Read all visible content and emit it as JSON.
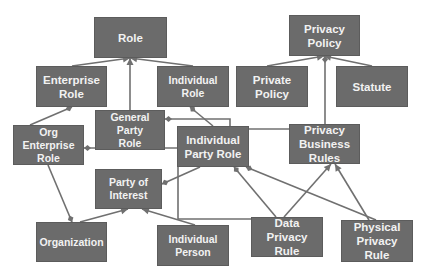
{
  "diagram": {
    "colors": {
      "node_fill": "#6b6b6b",
      "node_text": "#f2f2f2",
      "edge": "#707070",
      "background": "#ffffff"
    },
    "nodes": [
      {
        "id": "role",
        "label": "Role",
        "x": 94,
        "y": 17,
        "w": 73,
        "h": 41,
        "large": true
      },
      {
        "id": "enterprise_role",
        "label": "Enterprise\nRole",
        "x": 36,
        "y": 66,
        "w": 71,
        "h": 41,
        "large": true
      },
      {
        "id": "individual_role",
        "label": "Individual\nRole",
        "x": 157,
        "y": 66,
        "w": 72,
        "h": 41
      },
      {
        "id": "general_party_role",
        "label": "General Party\nRole",
        "x": 95,
        "y": 110,
        "w": 70,
        "h": 40
      },
      {
        "id": "org_enterprise_role",
        "label": "Org\nEnterprise\nRole",
        "x": 13,
        "y": 125,
        "w": 71,
        "h": 40
      },
      {
        "id": "individual_party_role",
        "label": "Individual\nParty Role",
        "x": 177,
        "y": 126,
        "w": 72,
        "h": 41,
        "large": true
      },
      {
        "id": "party_of_interest",
        "label": "Party of\nInterest",
        "x": 95,
        "y": 169,
        "w": 67,
        "h": 40
      },
      {
        "id": "organization",
        "label": "Organization",
        "x": 36,
        "y": 222,
        "w": 71,
        "h": 40
      },
      {
        "id": "individual_person",
        "label": "Individual\nPerson",
        "x": 157,
        "y": 225,
        "w": 72,
        "h": 41
      },
      {
        "id": "privacy_policy",
        "label": "Privacy\nPolicy",
        "x": 289,
        "y": 15,
        "w": 71,
        "h": 41,
        "large": true
      },
      {
        "id": "private_policy",
        "label": "Private\nPolicy",
        "x": 236,
        "y": 66,
        "w": 72,
        "h": 41,
        "large": true
      },
      {
        "id": "statute",
        "label": "Statute",
        "x": 336,
        "y": 66,
        "w": 72,
        "h": 41,
        "large": true
      },
      {
        "id": "privacy_business_rules",
        "label": "Privacy\nBusiness\nRules",
        "x": 289,
        "y": 124,
        "w": 71,
        "h": 40,
        "large": true
      },
      {
        "id": "data_privacy_rule",
        "label": "Data Privacy\nRule",
        "x": 251,
        "y": 217,
        "w": 72,
        "h": 40,
        "large": true
      },
      {
        "id": "physical_privacy_rule",
        "label": "Physical\nPrivacy Rule",
        "x": 341,
        "y": 220,
        "w": 72,
        "h": 42,
        "large": true
      }
    ],
    "edges": [
      {
        "from": "enterprise_role",
        "to": "role",
        "type": "generalization",
        "points": [
          [
            72,
            66
          ],
          [
            130,
            58
          ]
        ]
      },
      {
        "from": "individual_role",
        "to": "role",
        "type": "generalization",
        "points": [
          [
            193,
            66
          ],
          [
            130,
            58
          ]
        ]
      },
      {
        "from": "general_party_role",
        "to": "role",
        "type": "generalization",
        "points": [
          [
            130,
            110
          ],
          [
            130,
            58
          ]
        ]
      },
      {
        "from": "org_enterprise_role",
        "to": "enterprise_role",
        "type": "aggregation",
        "points": [
          [
            30,
            125
          ],
          [
            72,
            107
          ]
        ]
      },
      {
        "from": "individual_party_role",
        "to": "individual_role",
        "type": "aggregation",
        "points": [
          [
            213,
            126
          ],
          [
            190,
            107
          ]
        ]
      },
      {
        "from": "individual_party_role",
        "to": "general_party_role",
        "type": "aggregation",
        "points": [
          [
            230,
            126
          ],
          [
            230,
            119
          ],
          [
            165,
            119
          ]
        ]
      },
      {
        "from": "individual_party_role",
        "to": "org_enterprise_role",
        "type": "aggregation",
        "points": [
          [
            177,
            148
          ],
          [
            84,
            148
          ]
        ]
      },
      {
        "from": "individual_party_role",
        "to": "party_of_interest",
        "type": "aggregation",
        "points": [
          [
            200,
            167
          ],
          [
            162,
            184
          ]
        ]
      },
      {
        "from": "privacy_business_rules",
        "to": "individual_party_role",
        "type": "line",
        "points": [
          [
            289,
            129
          ],
          [
            249,
            129
          ]
        ]
      },
      {
        "from": "org_enterprise_role",
        "to": "organization",
        "type": "aggregation",
        "points": [
          [
            48,
            165
          ],
          [
            72,
            222
          ]
        ]
      },
      {
        "from": "organization",
        "to": "party_of_interest",
        "type": "generalization",
        "points": [
          [
            80,
            222
          ],
          [
            128,
            209
          ]
        ]
      },
      {
        "from": "individual_person",
        "to": "party_of_interest",
        "type": "generalization",
        "points": [
          [
            195,
            225
          ],
          [
            142,
            209
          ]
        ]
      },
      {
        "from": "data_privacy_rule",
        "to": "individual_party_role",
        "type": "line",
        "points": [
          [
            251,
            219
          ],
          [
            178,
            219
          ],
          [
            178,
            167
          ]
        ]
      },
      {
        "from": "private_policy",
        "to": "privacy_policy",
        "type": "generalization",
        "points": [
          [
            267,
            66
          ],
          [
            324,
            56
          ]
        ]
      },
      {
        "from": "statute",
        "to": "privacy_policy",
        "type": "generalization",
        "points": [
          [
            372,
            66
          ],
          [
            324,
            56
          ]
        ]
      },
      {
        "from": "privacy_business_rules",
        "to": "privacy_policy",
        "type": "aggregation",
        "points": [
          [
            325,
            124
          ],
          [
            325,
            56
          ]
        ]
      },
      {
        "from": "data_privacy_rule",
        "to": "individual_party_role",
        "type": "aggregation",
        "points": [
          [
            276,
            217
          ],
          [
            234,
            167
          ]
        ]
      },
      {
        "from": "physical_privacy_rule",
        "to": "individual_party_role",
        "type": "aggregation",
        "points": [
          [
            376,
            220
          ],
          [
            246,
            167
          ]
        ]
      },
      {
        "from": "data_privacy_rule",
        "to": "privacy_business_rules",
        "type": "generalization",
        "points": [
          [
            284,
            217
          ],
          [
            331,
            164
          ]
        ]
      },
      {
        "from": "physical_privacy_rule",
        "to": "privacy_business_rules",
        "type": "generalization",
        "points": [
          [
            369,
            220
          ],
          [
            335,
            164
          ]
        ]
      }
    ]
  }
}
